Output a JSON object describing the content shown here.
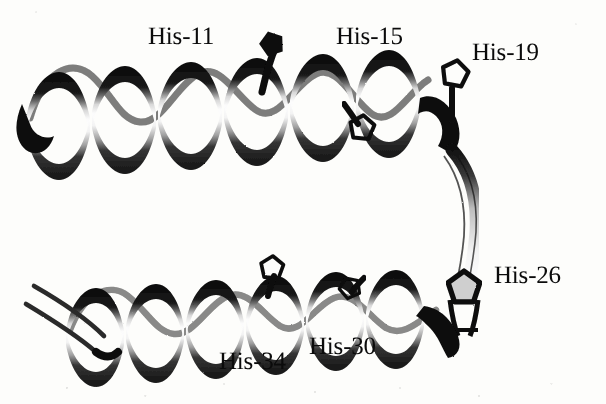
{
  "figure": {
    "kind": "molecular-ribbon-diagram",
    "background_color": "#fdfdfb",
    "ink_color": "#0b0b0b",
    "labels": [
      {
        "id": "his-11",
        "text": "His-11",
        "x": 148,
        "y": 24,
        "residue": "His",
        "number": "11",
        "helix": "upper"
      },
      {
        "id": "his-15",
        "text": "His-15",
        "x": 336,
        "y": 24,
        "residue": "His",
        "number": "15",
        "helix": "upper"
      },
      {
        "id": "his-19",
        "text": "His-19",
        "x": 472,
        "y": 40,
        "residue": "His",
        "number": "19",
        "helix": "upper"
      },
      {
        "id": "his-26",
        "text": "His-26",
        "x": 494,
        "y": 263,
        "residue": "His",
        "number": "26",
        "helix": "loop"
      },
      {
        "id": "his-30",
        "text": "His-30",
        "x": 309,
        "y": 334,
        "residue": "His",
        "number": "30",
        "helix": "lower"
      },
      {
        "id": "his-34",
        "text": "His-34",
        "x": 219,
        "y": 349,
        "residue": "His",
        "number": "34",
        "helix": "lower"
      }
    ],
    "structures": [
      {
        "id": "upper-helix",
        "name": "upper-alpha-helix",
        "turns": 6
      },
      {
        "id": "lower-helix",
        "name": "lower-alpha-helix",
        "turns": 5
      },
      {
        "id": "connector",
        "name": "interhelical-loop-strand"
      },
      {
        "id": "n-term-strands",
        "name": "lower-helix-terminal-strands"
      }
    ],
    "side_chains": [
      {
        "id": "sc-11",
        "name": "his-11-imidazole"
      },
      {
        "id": "sc-15",
        "name": "his-15-imidazole"
      },
      {
        "id": "sc-19",
        "name": "his-19-imidazole"
      },
      {
        "id": "sc-26",
        "name": "his-26-imidazole"
      },
      {
        "id": "sc-30",
        "name": "his-30-imidazole"
      },
      {
        "id": "sc-34",
        "name": "his-34-imidazole"
      }
    ]
  }
}
